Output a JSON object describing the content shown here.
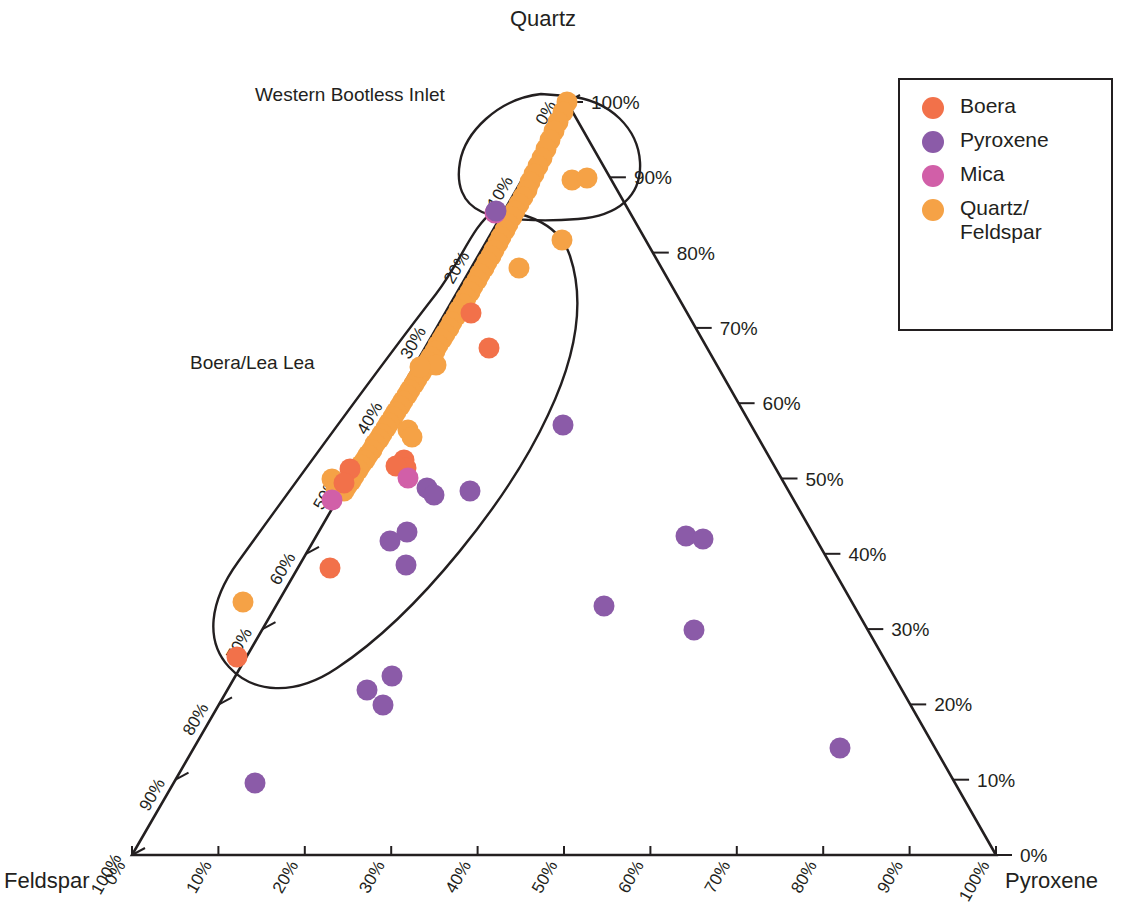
{
  "chart_data": {
    "type": "scatter",
    "subtype": "ternary",
    "title": "",
    "axes": {
      "top_vertex": "Quartz",
      "bottom_left_vertex": "Feldspar",
      "bottom_right_vertex": "Pyroxene",
      "left_axis_name": "Quartz",
      "left_axis_ticks": [
        "0%",
        "10%",
        "20%",
        "30%",
        "40%",
        "50%",
        "60%",
        "70%",
        "80%",
        "90%",
        "100%"
      ],
      "right_axis_name": "Pyroxene",
      "right_axis_ticks": [
        "100%",
        "90%",
        "80%",
        "70%",
        "60%",
        "50%",
        "40%",
        "30%",
        "20%",
        "10%",
        "0%"
      ],
      "bottom_axis_name": "Feldspar",
      "bottom_axis_ticks": [
        "0%",
        "10%",
        "20%",
        "30%",
        "40%",
        "50%",
        "60%",
        "70%",
        "80%",
        "90%",
        "100%"
      ],
      "grid": false,
      "range": [
        0,
        100
      ]
    },
    "legend": {
      "position": "top-right",
      "entries": [
        {
          "label": "Boera",
          "color": "#F2714A"
        },
        {
          "label": "Pyroxene",
          "color": "#8B5BA8"
        },
        {
          "label": "Mica",
          "color": "#D15FA8"
        },
        {
          "label": "Quartz/\nFeldspar",
          "color": "#F5A246"
        }
      ]
    },
    "annotations": [
      {
        "text": "Western Bootless Inlet",
        "kind": "group-outline-label"
      },
      {
        "text": "Boera/Lea Lea",
        "kind": "group-outline-label"
      }
    ],
    "series": [
      {
        "name": "Quartz/Feldspar",
        "color": "#F5A246",
        "points_px": [
          [
            567,
            102
          ],
          [
            563,
            112
          ],
          [
            558,
            122
          ],
          [
            554,
            131
          ],
          [
            550,
            140
          ],
          [
            546,
            149
          ],
          [
            542,
            158
          ],
          [
            538,
            166
          ],
          [
            534,
            174
          ],
          [
            530,
            182
          ],
          [
            527,
            190
          ],
          [
            523,
            197
          ],
          [
            519,
            204
          ],
          [
            515,
            211
          ],
          [
            512,
            217
          ],
          [
            508,
            224
          ],
          [
            505,
            230
          ],
          [
            501,
            237
          ],
          [
            498,
            243
          ],
          [
            494,
            250
          ],
          [
            491,
            256
          ],
          [
            487,
            262
          ],
          [
            484,
            268
          ],
          [
            480,
            274
          ],
          [
            477,
            280
          ],
          [
            473,
            286
          ],
          [
            470,
            292
          ],
          [
            466,
            298
          ],
          [
            463,
            304
          ],
          [
            459,
            310
          ],
          [
            456,
            316
          ],
          [
            452,
            322
          ],
          [
            449,
            328
          ],
          [
            445,
            334
          ],
          [
            442,
            339
          ],
          [
            438,
            345
          ],
          [
            435,
            351
          ],
          [
            431,
            357
          ],
          [
            428,
            362
          ],
          [
            424,
            368
          ],
          [
            421,
            373
          ],
          [
            417,
            379
          ],
          [
            414,
            384
          ],
          [
            410,
            390
          ],
          [
            407,
            395
          ],
          [
            403,
            401
          ],
          [
            400,
            406
          ],
          [
            396,
            412
          ],
          [
            393,
            417
          ],
          [
            389,
            423
          ],
          [
            386,
            428
          ],
          [
            382,
            434
          ],
          [
            379,
            439
          ],
          [
            375,
            444
          ],
          [
            372,
            450
          ],
          [
            368,
            455
          ],
          [
            365,
            460
          ],
          [
            361,
            465
          ],
          [
            358,
            470
          ],
          [
            354,
            476
          ],
          [
            351,
            481
          ],
          [
            347,
            486
          ],
          [
            344,
            491
          ],
          [
            572,
            180
          ],
          [
            587,
            178
          ],
          [
            562,
            240
          ],
          [
            519,
            268
          ],
          [
            436,
            365
          ],
          [
            420,
            367
          ],
          [
            408,
            430
          ],
          [
            412,
            437
          ],
          [
            332,
            479
          ],
          [
            336,
            489
          ],
          [
            243,
            602
          ]
        ]
      },
      {
        "name": "Boera",
        "color": "#F2714A",
        "points_px": [
          [
            471,
            313
          ],
          [
            489,
            348
          ],
          [
            404,
            460
          ],
          [
            406,
            468
          ],
          [
            396,
            466
          ],
          [
            330,
            568
          ],
          [
            237,
            657
          ],
          [
            350,
            469
          ],
          [
            344,
            483
          ]
        ]
      },
      {
        "name": "Mica",
        "color": "#D15FA8",
        "points_px": [
          [
            332,
            500
          ],
          [
            408,
            478
          ],
          [
            495,
            213
          ]
        ]
      },
      {
        "name": "Pyroxene",
        "color": "#8B5BA8",
        "points_px": [
          [
            496,
            211
          ],
          [
            427,
            488
          ],
          [
            434,
            495
          ],
          [
            470,
            491
          ],
          [
            407,
            532
          ],
          [
            390,
            541
          ],
          [
            406,
            565
          ],
          [
            563,
            425
          ],
          [
            686,
            536
          ],
          [
            703,
            539
          ],
          [
            604,
            606
          ],
          [
            694,
            630
          ],
          [
            367,
            690
          ],
          [
            392,
            676
          ],
          [
            383,
            705
          ],
          [
            840,
            748
          ],
          [
            255,
            783
          ]
        ]
      }
    ]
  },
  "legend_title": "",
  "corner_labels": {
    "quartz": "Quartz",
    "feldspar": "Feldspar",
    "pyroxene": "Pyroxene"
  },
  "group_labels": {
    "western_bootless_inlet": "Western Bootless Inlet",
    "boera_lea_lea": "Boera/Lea Lea"
  },
  "colors": {
    "boera": "#F2714A",
    "pyroxene": "#8B5BA8",
    "mica": "#D15FA8",
    "quartz_feldspar": "#F5A246",
    "line": "#231f20",
    "text": "#231f20"
  }
}
